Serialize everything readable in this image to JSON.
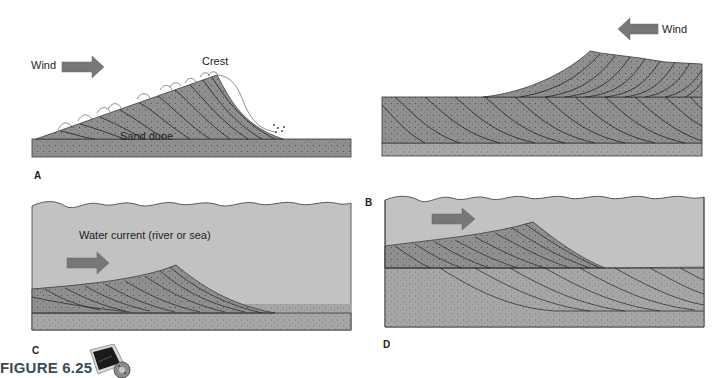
{
  "figure": {
    "title": "FIGURE 6.25",
    "icon": "media-player-cd-icon"
  },
  "colors": {
    "sediment": "#8f8f8f",
    "sediment_light": "#a8a8a8",
    "water": "#c2c2c2",
    "arrow": "#777777",
    "outline": "#3a3a3a",
    "title": "#3d4a55"
  },
  "panels": [
    {
      "letter": "A",
      "labels": {
        "wind": "Wind",
        "crest": "Crest",
        "dune": "Sand dune"
      },
      "arrow_direction": "right",
      "medium": "air"
    },
    {
      "letter": "B",
      "labels": {
        "wind": "Wind"
      },
      "arrow_direction": "left",
      "medium": "air"
    },
    {
      "letter": "C",
      "labels": {
        "current": "Water current (river or sea)"
      },
      "arrow_direction": "right",
      "medium": "water"
    },
    {
      "letter": "D",
      "labels": {},
      "arrow_direction": "right",
      "medium": "water"
    }
  ]
}
